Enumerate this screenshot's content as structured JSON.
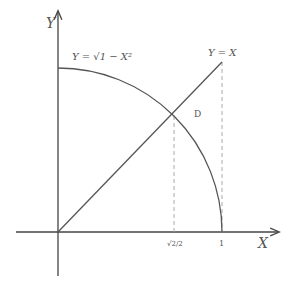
{
  "diagram": {
    "axes": {
      "x_label": "X",
      "y_label": "Y"
    },
    "curves": [
      {
        "label": "Y = √1 − X²",
        "type": "quarter-circle"
      },
      {
        "label": "Y = X",
        "type": "line"
      }
    ],
    "region_label": "D",
    "ticks": [
      {
        "label": "√2/2"
      },
      {
        "label": "1"
      }
    ],
    "colors": {
      "axis": "#444444",
      "curve": "#555555",
      "dashed": "#aaaaaa",
      "text": "#555555"
    }
  }
}
